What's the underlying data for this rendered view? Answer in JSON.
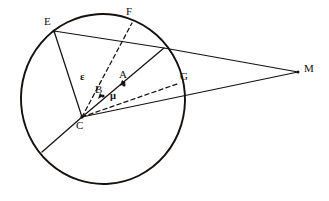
{
  "figure": {
    "width": 329,
    "height": 201,
    "background": "#ffffff",
    "ink_color": "#14110f"
  },
  "circle": {
    "name": "main-circle",
    "cx": 103,
    "cy": 99,
    "r": 85,
    "stroke": "#14110f",
    "stroke_width": 1.9
  },
  "points": {
    "E": {
      "label": "E",
      "x": 54,
      "y": 31,
      "label_x": 44,
      "label_y": 17,
      "on_circle": true
    },
    "F": {
      "label": "F",
      "x": 132,
      "y": 23,
      "label_x": 126,
      "label_y": 7,
      "on_circle": true
    },
    "G": {
      "label": "G",
      "x": 177,
      "y": 84,
      "label_x": 180,
      "label_y": 72,
      "on_circle": true
    },
    "C": {
      "label": "C",
      "x": 82,
      "y": 117,
      "label_x": 76,
      "label_y": 121,
      "on_circle": true
    },
    "M": {
      "label": "M",
      "x": 298,
      "y": 72,
      "label_x": 304,
      "label_y": 64,
      "on_circle": false
    },
    "A": {
      "label": "A",
      "x": 124,
      "y": 85,
      "label_x": 119,
      "label_y": 69,
      "on_circle": false
    },
    "B": {
      "label": "B",
      "x": 103,
      "y": 96,
      "label_x": 95,
      "label_y": 84,
      "on_circle": false
    },
    "D": {
      "label": "",
      "x": 164,
      "y": 48,
      "label_x": 0,
      "label_y": 0,
      "on_circle": true
    },
    "K": {
      "label": "",
      "x": 42,
      "y": 152,
      "label_x": 0,
      "label_y": 0,
      "on_circle": true
    }
  },
  "angle_labels": [
    {
      "name": "epsilon",
      "symbol": "ε",
      "x": 80,
      "y": 73
    },
    {
      "name": "mu",
      "symbol": "μ",
      "x": 110,
      "y": 92
    }
  ],
  "segments": [
    {
      "name": "segment-E-M",
      "from": "E",
      "to": "M",
      "style": "solid"
    },
    {
      "name": "segment-E-C",
      "from": "E",
      "to": "C",
      "style": "solid"
    },
    {
      "name": "segment-C-D-M",
      "from": "C",
      "to": "M",
      "style": "solid",
      "note": "ray through B and A to point on circle then to M"
    },
    {
      "name": "segment-C-M-lower",
      "from": "C",
      "to": "M",
      "style": "solid"
    },
    {
      "name": "segment-C-K",
      "from": "C",
      "to": "K",
      "style": "solid"
    },
    {
      "name": "segment-C-F",
      "from": "C",
      "to": "F",
      "style": "dashed"
    },
    {
      "name": "segment-C-G",
      "from": "C",
      "to": "G",
      "style": "dashed"
    }
  ]
}
